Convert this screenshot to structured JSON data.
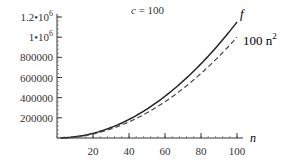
{
  "chart_data": {
    "type": "line",
    "title": "c = 100",
    "title_var": "c",
    "title_value": "= 100",
    "xlabel": "n",
    "ylabel": "",
    "xlim": [
      0,
      100
    ],
    "ylim": [
      0,
      1200000
    ],
    "x_ticks": [
      20,
      40,
      60,
      80,
      100
    ],
    "x_tick_labels": [
      "20",
      "40",
      "60",
      "80",
      "100"
    ],
    "y_ticks": [
      200000,
      400000,
      600000,
      800000,
      1000000,
      1200000
    ],
    "y_tick_labels": [
      "200000",
      "400000",
      "600000",
      "800000",
      "1•10",
      "1.2•10"
    ],
    "y_tick_exponents": [
      "",
      "",
      "",
      "",
      "6",
      "6"
    ],
    "grid": false,
    "legend_position": "inline-right",
    "series": [
      {
        "name": "f",
        "label": "f",
        "style": "solid",
        "color": "#222222",
        "x": [
          0,
          10,
          20,
          30,
          40,
          50,
          60,
          70,
          80,
          90,
          100
        ],
        "values": [
          0,
          11500,
          46000,
          103500,
          184000,
          287500,
          414000,
          563500,
          736000,
          931500,
          1150000
        ]
      },
      {
        "name": "100 n^2",
        "label": "100 n",
        "label_exp": "2",
        "style": "dashed",
        "color": "#444444",
        "x": [
          0,
          10,
          20,
          30,
          40,
          50,
          60,
          70,
          80,
          90,
          100
        ],
        "values": [
          0,
          10000,
          40000,
          90000,
          160000,
          250000,
          360000,
          490000,
          640000,
          810000,
          1000000
        ]
      }
    ]
  }
}
